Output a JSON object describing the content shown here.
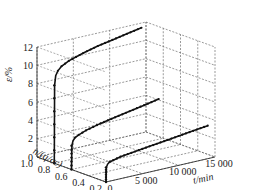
{
  "chart_data": {
    "type": "line",
    "subtype": "3d-waterfall",
    "title": "",
    "zlabel": "ε/%",
    "ylabel": "n/(q/σc)",
    "xlabel": "t/min",
    "zticks": [
      "0",
      "2",
      "4",
      "6",
      "8",
      "10",
      "12"
    ],
    "yticks": [
      "1.0",
      "0.8",
      "0.6",
      "0.4",
      "0.2"
    ],
    "xticks": [
      "0",
      "5 000",
      "10 000",
      "15 000"
    ],
    "zlim": [
      0,
      12
    ],
    "ylim": [
      0.2,
      1.0
    ],
    "xlim": [
      0,
      15000
    ],
    "grid": true,
    "series": [
      {
        "name": "n=0.8",
        "n": 0.8,
        "t": [
          0,
          50,
          200,
          500,
          1000,
          2000,
          4000,
          6000,
          8000,
          10000,
          12000
        ],
        "strain": [
          0,
          8.5,
          9.5,
          10.0,
          10.4,
          10.8,
          11.3,
          11.7,
          12.0,
          12.3,
          12.6
        ]
      },
      {
        "name": "n=0.6",
        "n": 0.6,
        "t": [
          0,
          50,
          200,
          500,
          1000,
          2000,
          4000,
          6000,
          8000,
          10000,
          12000
        ],
        "strain": [
          0,
          2.6,
          3.1,
          3.4,
          3.6,
          3.9,
          4.3,
          4.6,
          4.9,
          5.2,
          5.5
        ]
      },
      {
        "name": "n=0.2",
        "n": 0.2,
        "t": [
          0,
          50,
          200,
          500,
          1000,
          2000,
          4000,
          6000,
          8000,
          10000,
          12000,
          14000
        ],
        "strain": [
          0,
          1.6,
          1.9,
          2.1,
          2.2,
          2.4,
          2.6,
          2.8,
          3.0,
          3.2,
          3.4,
          3.6
        ]
      }
    ]
  }
}
